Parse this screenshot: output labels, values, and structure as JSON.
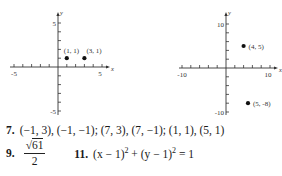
{
  "chart_data": [
    {
      "type": "scatter",
      "title": "",
      "xlabel": "x",
      "ylabel": "y",
      "xlim": [
        -5,
        5
      ],
      "ylim": [
        -5,
        5
      ],
      "x_tick_labels": [
        "-5",
        "5"
      ],
      "y_tick_labels": [
        "5",
        "-5"
      ],
      "tick_step": 1,
      "points": [
        {
          "x": 1,
          "y": 1,
          "label": "(1, 1)"
        },
        {
          "x": 3,
          "y": 1,
          "label": "(3, 1)"
        }
      ],
      "grid": false
    },
    {
      "type": "scatter",
      "title": "",
      "xlabel": "x",
      "ylabel": "y",
      "xlim": [
        -10,
        10
      ],
      "ylim": [
        -10,
        10
      ],
      "x_tick_labels": [
        "-10",
        "10"
      ],
      "y_tick_labels": [
        "10",
        "-10"
      ],
      "tick_step": 2,
      "points": [
        {
          "x": 4,
          "y": 5,
          "label": "(4, 5)"
        },
        {
          "x": 5,
          "y": -8,
          "label": "(5, -8)"
        }
      ],
      "grid": false
    }
  ],
  "answers": {
    "a7": {
      "number": "7.",
      "text": "(−1, 3), (−1, −1); (7, 3), (7, −1); (1, 1), (5, 1)"
    },
    "a9": {
      "number": "9.",
      "numerator_radicand": "61",
      "radical": "√",
      "denominator": "2"
    },
    "a11": {
      "number": "11.",
      "part1": "(x − 1)",
      "exp1": "2",
      "part2": " + (y − 1)",
      "exp2": "2",
      "part3": " = 1"
    }
  }
}
